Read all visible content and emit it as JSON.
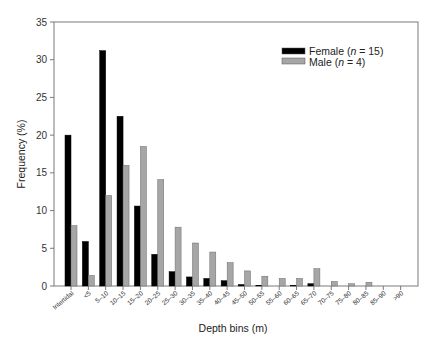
{
  "chart_data": {
    "type": "bar",
    "title": "",
    "xlabel": "Depth bins (m)",
    "ylabel": "Frequency (%)",
    "ylim": [
      0,
      35
    ],
    "yticks": [
      0,
      5,
      10,
      15,
      20,
      25,
      30,
      35
    ],
    "grid": false,
    "legend_position": "upper right",
    "categories": [
      "Intertidal",
      "<5",
      "5–10",
      "10–15",
      "15–20",
      "20–25",
      "25–30",
      "30–35",
      "35–40",
      "40–45",
      "45–50",
      "50–55",
      "55–60",
      "60–65",
      "65–70",
      "70–75",
      "75–80",
      "80–85",
      "85–90",
      ">90"
    ],
    "series": [
      {
        "name": "Female (n = 15)",
        "name_prefix": "Female (",
        "name_italic": "n",
        "name_suffix": " = 15)",
        "color": "#000000",
        "values": [
          20.0,
          5.9,
          31.2,
          22.5,
          10.6,
          4.2,
          1.9,
          1.2,
          1.0,
          0.7,
          0.2,
          0.1,
          0.0,
          0.1,
          0.3,
          0.0,
          0.0,
          0.0,
          0.0,
          0.0
        ]
      },
      {
        "name": "Male (n = 4)",
        "name_prefix": "Male (",
        "name_italic": "n",
        "name_suffix": " = 4)",
        "color": "#a6a6a6",
        "values": [
          8.0,
          1.4,
          12.0,
          16.0,
          18.5,
          14.1,
          7.8,
          5.7,
          4.5,
          3.1,
          2.0,
          1.3,
          1.0,
          1.0,
          2.3,
          0.6,
          0.3,
          0.5,
          0.0,
          0.0
        ]
      }
    ]
  }
}
